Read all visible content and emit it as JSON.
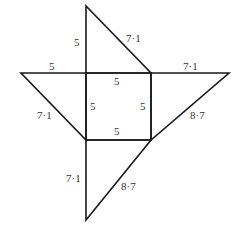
{
  "diagram": {
    "stroke_color": "#1a1a1a",
    "labels": {
      "top_left_edge": "5",
      "top_hypotenuse": "7·1",
      "left_top_edge": "5",
      "right_top_edge": "7·1",
      "square_top": "5",
      "square_left": "5",
      "square_right": "5",
      "square_bottom": "5",
      "left_hypotenuse": "7·1",
      "right_hypotenuse": "8·7",
      "bottom_left_edge": "7·1",
      "bottom_hypotenuse": "8·7"
    }
  }
}
